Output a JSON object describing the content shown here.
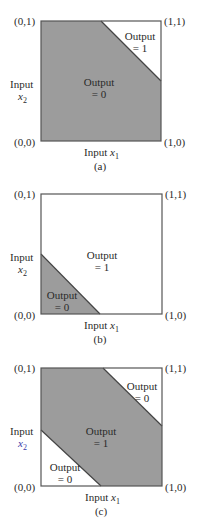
{
  "colors": {
    "fill": "#9c9c9c",
    "border": "#555555",
    "background": "#ffffff"
  },
  "corners": {
    "top_left": "(0,1)",
    "top_right": "(1,1)",
    "bottom_left": "(0,0)",
    "bottom_right": "(1,0)"
  },
  "axis": {
    "y_label_line1": "Input",
    "y_var": "x",
    "y_sub": "2",
    "x_label": "Input ",
    "x_var": "x",
    "x_sub": "1"
  },
  "panels": [
    {
      "caption": "(a)",
      "description": "AND-like boundary: Output = 1 only in top-right corner",
      "regions": [
        {
          "line1": "Output",
          "line2": "= 1",
          "shaded": false
        },
        {
          "line1": "Output",
          "line2": "= 0",
          "shaded": true
        }
      ],
      "boundary": [
        [
          0.5,
          1
        ],
        [
          1,
          0.5
        ]
      ]
    },
    {
      "caption": "(b)",
      "description": "OR-like boundary: Output = 0 only in bottom-left corner",
      "regions": [
        {
          "line1": "Output",
          "line2": "= 1",
          "shaded": false
        },
        {
          "line1": "Output",
          "line2": "= 0",
          "shaded": true
        }
      ],
      "boundary": [
        [
          0,
          0.5
        ],
        [
          0.5,
          0
        ]
      ]
    },
    {
      "caption": "(c)",
      "description": "XOR-like: Output = 1 in diagonal band, 0 in both corners",
      "regions": [
        {
          "line1": "Output",
          "line2": "= 0",
          "shaded": false
        },
        {
          "line1": "Output",
          "line2": "= 1",
          "shaded": true
        },
        {
          "line1": "Output",
          "line2": "= 0",
          "shaded": false
        }
      ],
      "boundaries": [
        [
          [
            0.5,
            1
          ],
          [
            1,
            0.5
          ]
        ],
        [
          [
            0,
            0.5
          ],
          [
            0.5,
            0
          ]
        ]
      ]
    }
  ]
}
